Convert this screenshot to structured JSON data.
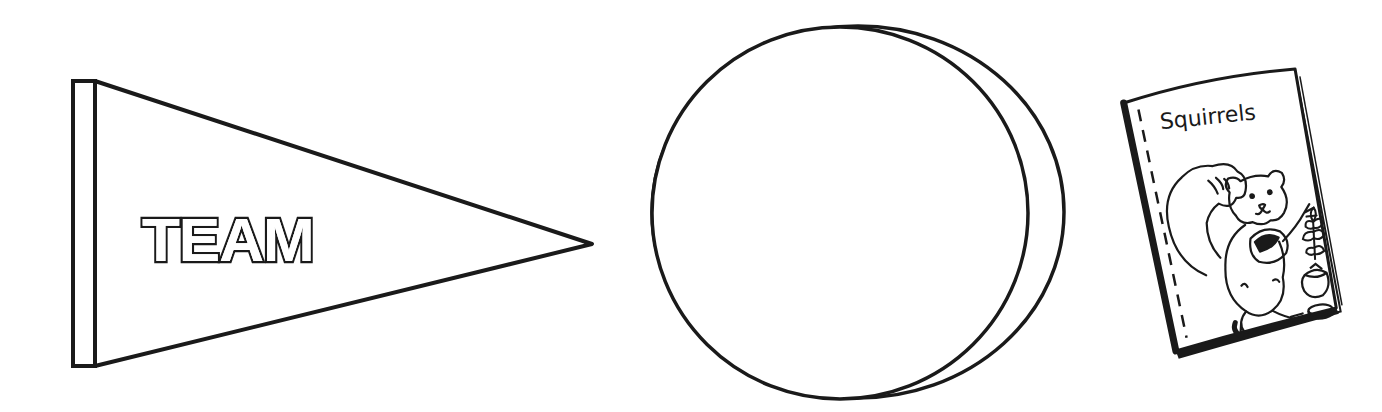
{
  "canvas": {
    "width": 1382,
    "height": 412,
    "background": "#ffffff",
    "ink": "#1a1a1a"
  },
  "items": [
    {
      "id": "pennant",
      "kind": "pennant-flag",
      "label": "TEAM",
      "style": "outlined block letters"
    },
    {
      "id": "circle-badge",
      "kind": "blank-circle-with-offset-edge",
      "label": ""
    },
    {
      "id": "book",
      "kind": "book-cover",
      "title": "Squirrels",
      "illustration": "squirrel holding a nut beside an acorn, nut and leafy sprig"
    }
  ]
}
